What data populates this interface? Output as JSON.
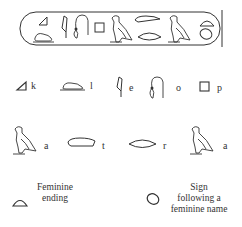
{
  "cartouche": {
    "glyphs": [
      "triangle",
      "lion",
      "reed",
      "rope-loop",
      "square",
      "vulture",
      "hand",
      "mouth",
      "vulture",
      "bread-loaf",
      "egg"
    ]
  },
  "row1": [
    {
      "glyph": "triangle-icon",
      "letter": "k"
    },
    {
      "glyph": "lion-icon",
      "letter": "l"
    },
    {
      "glyph": "reed-icon",
      "letter": "e"
    },
    {
      "glyph": "rope-loop-icon",
      "letter": "o"
    },
    {
      "glyph": "square-icon",
      "letter": "p"
    }
  ],
  "row2": [
    {
      "glyph": "vulture-icon",
      "letter": "a"
    },
    {
      "glyph": "hand-icon",
      "letter": "t"
    },
    {
      "glyph": "mouth-icon",
      "letter": "r"
    },
    {
      "glyph": "vulture-icon",
      "letter": "a"
    }
  ],
  "legend": {
    "feminine_ending": {
      "line1": "Feminine",
      "line2": "ending"
    },
    "feminine_name": {
      "line1": "Sign",
      "line2": "following a",
      "line3": "feminine name"
    }
  },
  "colors": {
    "ink": "#2a2a2a",
    "background": "#ffffff"
  }
}
